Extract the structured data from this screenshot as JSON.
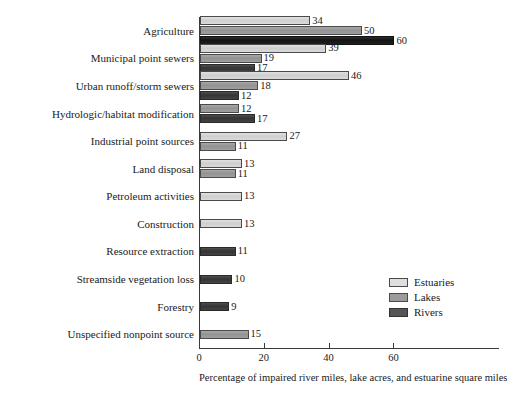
{
  "chart_data": {
    "type": "bar",
    "orientation": "horizontal",
    "title": "",
    "xlabel": "Percentage of impaired river miles, lake acres, and estuarine square miles",
    "ylabel": "",
    "xlim": [
      0,
      62
    ],
    "xticks": [
      0,
      20,
      40,
      60
    ],
    "xtick_labels": [
      "0",
      "20",
      "40",
      "60"
    ],
    "grid": false,
    "legend_position": "center-right",
    "series": [
      {
        "name": "Estuaries",
        "color": "#dedede"
      },
      {
        "name": "Lakes",
        "color": "#9b9b9b"
      },
      {
        "name": "Rivers",
        "color": "#555555"
      }
    ],
    "categories": [
      "Agriculture",
      "Municipal point sewers",
      "Urban runoff/storm sewers",
      "Hydrologic/habitat modification",
      "Industrial point sources",
      "Land disposal",
      "Petroleum activities",
      "Construction",
      "Resource extraction",
      "Streamside vegetation loss",
      "Forestry",
      "Unspecified nonpoint source"
    ],
    "rows": [
      {
        "category": "Agriculture",
        "bars": [
          {
            "series": "Estuaries",
            "value": 34,
            "label": "34"
          },
          {
            "series": "Lakes",
            "value": 50,
            "label": "50"
          },
          {
            "series": "Rivers",
            "value": 60,
            "label": "60"
          }
        ]
      },
      {
        "category": "Municipal point sewers",
        "bars": [
          {
            "series": "Estuaries",
            "value": 39,
            "label": "39"
          },
          {
            "series": "Lakes",
            "value": 19,
            "label": "19"
          },
          {
            "series": "Rivers",
            "value": 17,
            "label": "17"
          }
        ]
      },
      {
        "category": "Urban runoff/storm sewers",
        "bars": [
          {
            "series": "Estuaries",
            "value": 46,
            "label": "46"
          },
          {
            "series": "Lakes",
            "value": 18,
            "label": "18"
          },
          {
            "series": "Rivers",
            "value": 12,
            "label": "12"
          }
        ]
      },
      {
        "category": "Hydrologic/habitat modification",
        "bars": [
          {
            "series": "Lakes",
            "value": 12,
            "label": "12"
          },
          {
            "series": "Rivers",
            "value": 17,
            "label": "17"
          }
        ]
      },
      {
        "category": "Industrial point sources",
        "bars": [
          {
            "series": "Estuaries",
            "value": 27,
            "label": "27"
          },
          {
            "series": "Lakes",
            "value": 11,
            "label": "11"
          }
        ]
      },
      {
        "category": "Land disposal",
        "bars": [
          {
            "series": "Estuaries",
            "value": 13,
            "label": "13"
          },
          {
            "series": "Lakes",
            "value": 11,
            "label": "11"
          }
        ]
      },
      {
        "category": "Petroleum activities",
        "bars": [
          {
            "series": "Estuaries",
            "value": 13,
            "label": "13"
          }
        ]
      },
      {
        "category": "Construction",
        "bars": [
          {
            "series": "Estuaries",
            "value": 13,
            "label": "13"
          }
        ]
      },
      {
        "category": "Resource extraction",
        "bars": [
          {
            "series": "Rivers",
            "value": 11,
            "label": "11"
          }
        ]
      },
      {
        "category": "Streamside vegetation loss",
        "bars": [
          {
            "series": "Rivers",
            "value": 10,
            "label": "10"
          }
        ]
      },
      {
        "category": "Forestry",
        "bars": [
          {
            "series": "Rivers",
            "value": 9,
            "label": "9"
          }
        ]
      },
      {
        "category": "Unspecified nonpoint source",
        "bars": [
          {
            "series": "Lakes",
            "value": 15,
            "label": "15"
          }
        ]
      }
    ]
  },
  "legend": {
    "items": [
      {
        "label": "Estuaries",
        "key": "estuaries"
      },
      {
        "label": "Lakes",
        "key": "lakes"
      },
      {
        "label": "Rivers",
        "key": "rivers"
      }
    ]
  }
}
